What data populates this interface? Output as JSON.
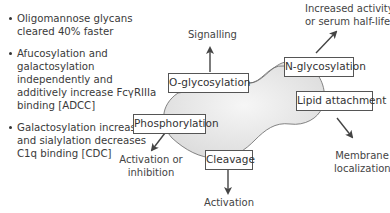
{
  "bullets": [
    {
      "text": "Oligomannose glycans cleared 40% faster"
    },
    {
      "text": "Afucosylation and galactosylation independently and additively increase FcγRIIIa binding [ADCC]"
    },
    {
      "text": "Galactosylation increases and sialylation decreases C1q binding [CDC]"
    }
  ],
  "modifications": {
    "o_glycosylation": "O-glycosylation",
    "n_glycosylation": "N-glycosylation",
    "lipid_attachment": "Lipid attachment",
    "phosphorylation": "Phosphorylation",
    "cleavage": "Cleavage"
  },
  "outcomes": {
    "signalling": "Signalling",
    "increased_activity_1": "Increased activity",
    "increased_activity_2": "or serum half-life",
    "membrane_1": "Membrane",
    "membrane_2": "localization",
    "activation_inhibition_1": "Activation or",
    "activation_inhibition_2": "inhibition",
    "activation": "Activation"
  },
  "colors": {
    "blob_fill": "#e6e6e6",
    "arrow": "#444444",
    "box_border": "#555555"
  }
}
